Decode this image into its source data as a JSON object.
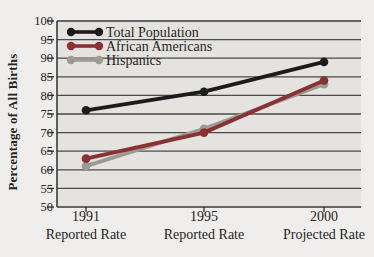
{
  "colors": {
    "page_bg": "#efeeec",
    "plot_bg": "#e4e3e0",
    "grid": "#4b4a47",
    "axis": "#3b3a38",
    "text": "#262523"
  },
  "chart_data": {
    "type": "line",
    "title": "",
    "xlabel": "",
    "ylabel": "Percentage of All Births",
    "ylim": [
      50,
      100
    ],
    "yticks": [
      50,
      55,
      60,
      65,
      70,
      75,
      80,
      85,
      90,
      95,
      100
    ],
    "grid": true,
    "legend_position": "top-left",
    "categories": [
      "1991",
      "1995",
      "2000"
    ],
    "category_sublabels": [
      "Reported Rate",
      "Reported Rate",
      "Projected Rate"
    ],
    "series": [
      {
        "name": "Total Population",
        "color": "#1c1c1c",
        "values": [
          76,
          81,
          89
        ]
      },
      {
        "name": "African Americans",
        "color": "#8a3134",
        "values": [
          63,
          70,
          84
        ]
      },
      {
        "name": "Hispanics",
        "color": "#9d9a95",
        "values": [
          61,
          71,
          83
        ]
      }
    ]
  }
}
